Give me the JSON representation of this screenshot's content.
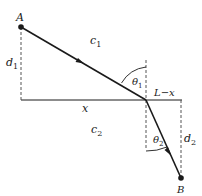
{
  "diagram": {
    "colors": {
      "line": "#1a1a1a",
      "dashed": "#555555",
      "background": "#ffffff"
    },
    "points": {
      "A": {
        "label": "A",
        "x": 21,
        "y": 27
      },
      "P": {
        "x": 146,
        "y": 100
      },
      "B": {
        "label": "B",
        "x": 181,
        "y": 178
      }
    },
    "labels": {
      "point_a": "A",
      "point_b": "B",
      "medium_1_speed": "c",
      "medium_1_sub": "1",
      "medium_2_speed": "c",
      "medium_2_sub": "2",
      "d1": "d",
      "d1_sub": "1",
      "d2": "d",
      "d2_sub": "2",
      "x": "x",
      "l_minus_x": "L−x",
      "theta1": "θ",
      "theta1_sub": "1",
      "theta2": "θ",
      "theta2_sub": "2"
    }
  }
}
